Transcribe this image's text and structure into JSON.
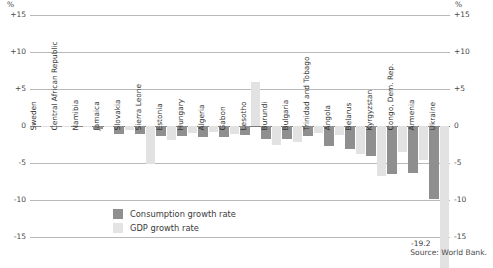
{
  "axis": {
    "unit_label": "%",
    "ticks": [
      "+15",
      "+10",
      "+5",
      "0",
      "-5",
      "-10",
      "-15"
    ]
  },
  "legend": {
    "consumption_label": "Consumption growth rate",
    "gdp_label": "GDP growth rate",
    "consumption_color": "#8f8f8f",
    "gdp_color": "#e2e2e2"
  },
  "source": "Source: World Bank.",
  "annotations": {
    "ukraine_gdp_value": "-19.2"
  },
  "chart_data": {
    "type": "bar",
    "title": "",
    "xlabel": "",
    "ylabel": "%",
    "ylim": [
      -15,
      15
    ],
    "grid": true,
    "legend_position": "bottom-left",
    "categories": [
      "Sweden",
      "Central African Republic",
      "Namibia",
      "Jamaica",
      "Slovakia",
      "Sierra Leone",
      "Estonia",
      "Hungary",
      "Algeria",
      "Gabon",
      "Lesotho",
      "Burundi",
      "Bulgaria",
      "Trinidad and Tobago",
      "Angola",
      "Belarus",
      "Kyrgyzstan",
      "Congo, Dem. Rep.",
      "Armenia",
      "Ukraine"
    ],
    "series": [
      {
        "name": "Consumption growth rate",
        "color": "#8f8f8f",
        "values": [
          -0.1,
          -0.1,
          -0.1,
          -0.4,
          -1.1,
          -1.1,
          -1.3,
          -1.4,
          -1.5,
          -1.5,
          -1.2,
          -1.8,
          -1.8,
          -1.4,
          -2.7,
          -3.1,
          -4.0,
          -6.5,
          -6.3,
          -9.8
        ]
      },
      {
        "name": "GDP growth rate",
        "color": "#e2e2e2",
        "values": [
          -0.2,
          -0.1,
          -0.2,
          -0.2,
          -0.5,
          -5.1,
          -1.9,
          -1.0,
          -0.8,
          -1.1,
          6.0,
          -2.5,
          -2.2,
          -1.0,
          -1.2,
          -3.8,
          -6.7,
          -3.5,
          -4.6,
          -19.2
        ]
      }
    ]
  }
}
